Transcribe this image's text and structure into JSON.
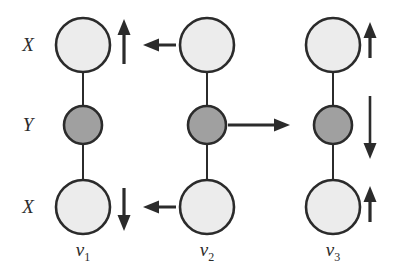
{
  "figure": {
    "background_color": "#ffffff",
    "stroke_color": "#2b2b2b",
    "atom_colors": {
      "X": "#ececec",
      "Y": "#a0a0a0"
    },
    "atom_labels": [
      {
        "id": "atom-label-x-top",
        "text": "X",
        "x": 27,
        "y": 45
      },
      {
        "id": "atom-label-y-middle",
        "text": "Y",
        "x": 27,
        "y": 125
      },
      {
        "id": "atom-label-x-bottom",
        "text": "X",
        "x": 27,
        "y": 207
      }
    ],
    "columns": [
      {
        "id": "mode-nu1",
        "label": "ν",
        "subscript": "1",
        "label_x": 83,
        "label_y": 240,
        "center_x": 83,
        "atoms": [
          {
            "name": "atom-x-top",
            "species": "X",
            "cy": 45,
            "r": 27,
            "fill": "#ececec"
          },
          {
            "name": "atom-y-middle",
            "species": "Y",
            "cy": 125,
            "r": 19,
            "fill": "#a0a0a0"
          },
          {
            "name": "atom-x-bottom",
            "species": "X",
            "cy": 207,
            "r": 27,
            "fill": "#ececec"
          }
        ],
        "bonds": [
          {
            "name": "bond-top",
            "x": 83,
            "y1": 72,
            "y2": 106
          },
          {
            "name": "bond-bottom",
            "x": 83,
            "y1": 144,
            "y2": 180
          }
        ],
        "arrows": [
          {
            "name": "arrow-x-top-up",
            "direction": "up",
            "x": 124,
            "y1": 64,
            "y2": 22,
            "length": 42
          },
          {
            "name": "arrow-x-bottom-down",
            "direction": "down",
            "x": 124,
            "y1": 188,
            "y2": 228,
            "length": 40
          }
        ]
      },
      {
        "id": "mode-nu2",
        "label": "ν",
        "subscript": "2",
        "label_x": 207,
        "label_y": 240,
        "center_x": 207,
        "atoms": [
          {
            "name": "atom-x-top",
            "species": "X",
            "cy": 45,
            "r": 27,
            "fill": "#ececec"
          },
          {
            "name": "atom-y-middle",
            "species": "Y",
            "cy": 125,
            "r": 19,
            "fill": "#a0a0a0"
          },
          {
            "name": "atom-x-bottom",
            "species": "X",
            "cy": 207,
            "r": 27,
            "fill": "#ececec"
          }
        ],
        "bonds": [
          {
            "name": "bond-top",
            "x": 207,
            "y1": 72,
            "y2": 106
          },
          {
            "name": "bond-bottom",
            "x": 207,
            "y1": 144,
            "y2": 180
          }
        ],
        "arrows": [
          {
            "name": "arrow-x-top-left",
            "direction": "left",
            "y": 45,
            "x1": 176,
            "x2": 144,
            "length": 32
          },
          {
            "name": "arrow-y-middle-right",
            "direction": "right",
            "y": 125,
            "x1": 228,
            "x2": 288,
            "length": 60
          },
          {
            "name": "arrow-x-bottom-left",
            "direction": "left",
            "y": 207,
            "x1": 176,
            "x2": 144,
            "length": 32
          }
        ]
      },
      {
        "id": "mode-nu3",
        "label": "ν",
        "subscript": "3",
        "label_x": 333,
        "label_y": 240,
        "center_x": 333,
        "atoms": [
          {
            "name": "atom-x-top",
            "species": "X",
            "cy": 45,
            "r": 27,
            "fill": "#ececec"
          },
          {
            "name": "atom-y-middle",
            "species": "Y",
            "cy": 125,
            "r": 19,
            "fill": "#a0a0a0"
          },
          {
            "name": "atom-x-bottom",
            "species": "X",
            "cy": 207,
            "r": 27,
            "fill": "#ececec"
          }
        ],
        "bonds": [
          {
            "name": "bond-top",
            "x": 333,
            "y1": 72,
            "y2": 106
          },
          {
            "name": "bond-bottom",
            "x": 333,
            "y1": 144,
            "y2": 180
          }
        ],
        "arrows": [
          {
            "name": "arrow-x-top-up",
            "direction": "up",
            "x": 370,
            "y1": 58,
            "y2": 24,
            "length": 34
          },
          {
            "name": "arrow-y-middle-down",
            "direction": "down",
            "x": 370,
            "y1": 96,
            "y2": 156,
            "length": 60
          },
          {
            "name": "arrow-x-bottom-up",
            "direction": "up",
            "x": 370,
            "y1": 222,
            "y2": 188,
            "length": 34
          }
        ]
      }
    ]
  }
}
